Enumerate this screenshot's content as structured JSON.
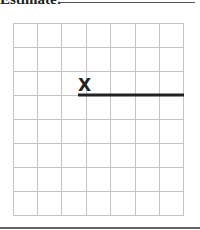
{
  "header": {
    "label": "Estimate:"
  },
  "grid": {
    "columns": 7,
    "rows": 8,
    "line_color": "#c8c8c8"
  },
  "drawing": {
    "marker_symbol": "X",
    "segment": {
      "start_col": 2.7,
      "end_col": 7,
      "row": 3,
      "color": "#222222"
    }
  }
}
